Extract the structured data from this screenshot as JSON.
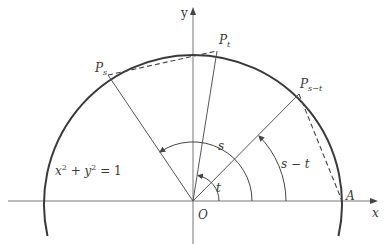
{
  "diagram": {
    "type": "unit-circle-angle-difference",
    "colors": {
      "circle": "#3a3a3a",
      "axes": "#777777",
      "radii": "#555555",
      "chords": "#444444",
      "text": "#3a3a3a"
    },
    "axes": {
      "x_label": "x",
      "y_label": "y",
      "origin_label": "O"
    },
    "equation": {
      "base1": "x",
      "exp1": "2",
      "plus": " + ",
      "base2": "y",
      "exp2": "2",
      "rest": " = 1"
    },
    "points": {
      "A": {
        "label": "A"
      },
      "P_t": {
        "label": "P",
        "sub": "t"
      },
      "P_s": {
        "label": "P",
        "sub": "s"
      },
      "P_s_minus_t": {
        "label": "P",
        "sub": "s−t"
      }
    },
    "angles": {
      "t": "t",
      "s": "s",
      "s_minus_t": "s − t"
    }
  }
}
